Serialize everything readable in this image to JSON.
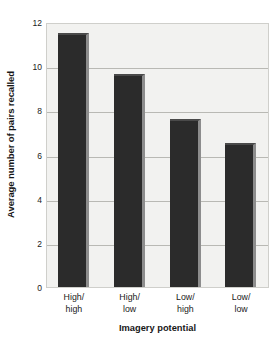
{
  "chart_data": {
    "type": "bar",
    "title": "",
    "xlabel": "Imagery potential",
    "ylabel": "Average number of pairs recalled",
    "categories": [
      "High/ high",
      "High/ low",
      "Low/ high",
      "Low/ low"
    ],
    "category_lines": [
      [
        "High/",
        "high"
      ],
      [
        "High/",
        "low"
      ],
      [
        "Low/",
        "high"
      ],
      [
        "Low/",
        "low"
      ]
    ],
    "values": [
      11.6,
      9.7,
      7.65,
      6.55
    ],
    "ylim": [
      0,
      12
    ],
    "yticks": [
      0,
      2,
      4,
      6,
      8,
      10,
      12
    ],
    "ytick_labels": [
      "0",
      "2",
      "4",
      "6",
      "8",
      "10",
      "12"
    ],
    "grid": true,
    "grid_axis": "y",
    "legend": "none",
    "bar_color": "#2b2b2b",
    "bar_edge_color": "#8d8d8d",
    "plot_background": "#f2f2f0",
    "gridline_color": "#b9b9b4",
    "axis_color": "#cfcfcb"
  }
}
